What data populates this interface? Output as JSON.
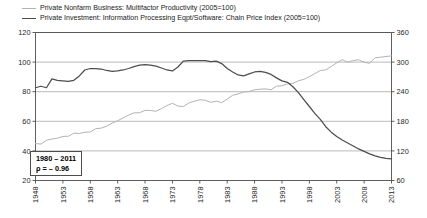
{
  "legend": {
    "position": "top-left",
    "items": [
      {
        "label": "Private Nonfarm Business: Multifactor Productivity (2005=100)",
        "color": "#b3b3b3",
        "axis": "left"
      },
      {
        "label": "Private Investment: Information Processing Eqpt/Software: Chain Price Index (2005=100)",
        "color": "#4d4d4d",
        "axis": "right"
      }
    ]
  },
  "annotation": {
    "period": "1980 – 2011",
    "correlation": "ρ = – 0.96"
  },
  "axes": {
    "left": {
      "min": 20,
      "max": 120,
      "step": 20,
      "ticks": [
        "20",
        "40",
        "60",
        "80",
        "100",
        "120"
      ]
    },
    "right": {
      "min": 60,
      "max": 360,
      "step": 60,
      "ticks": [
        "60",
        "120",
        "180",
        "240",
        "300",
        "360"
      ]
    },
    "x": {
      "min": 1948,
      "max": 2013,
      "step": 5,
      "ticks": [
        "1948",
        "1953",
        "1958",
        "1963",
        "1968",
        "1973",
        "1978",
        "1983",
        "1988",
        "1993",
        "1998",
        "2003",
        "2008",
        "2013"
      ]
    }
  },
  "chart_data": {
    "type": "line",
    "title": "",
    "subtitle": "",
    "xlabel": "",
    "ylabel": "",
    "grid": true,
    "legend_position": "top-left",
    "xlim": [
      1948,
      2013
    ],
    "ylim": [
      20,
      120
    ],
    "ylim_right": [
      60,
      360
    ],
    "x": [
      1948,
      1949,
      1950,
      1951,
      1952,
      1953,
      1954,
      1955,
      1956,
      1957,
      1958,
      1959,
      1960,
      1961,
      1962,
      1963,
      1964,
      1965,
      1966,
      1967,
      1968,
      1969,
      1970,
      1971,
      1972,
      1973,
      1974,
      1975,
      1976,
      1977,
      1978,
      1979,
      1980,
      1981,
      1982,
      1983,
      1984,
      1985,
      1986,
      1987,
      1988,
      1989,
      1990,
      1991,
      1992,
      1993,
      1994,
      1995,
      1996,
      1997,
      1998,
      1999,
      2000,
      2001,
      2002,
      2003,
      2004,
      2005,
      2006,
      2007,
      2008,
      2009,
      2010,
      2011,
      2012,
      2013
    ],
    "series": [
      {
        "name": "Private Nonfarm Business: Multifactor Productivity (2005=100)",
        "axis": "left",
        "color": "#b3b3b3",
        "units": "index, 2005=100",
        "values": [
          45.0,
          44.6,
          47.2,
          48.0,
          48.6,
          49.8,
          49.9,
          52.0,
          51.8,
          52.6,
          52.8,
          55.0,
          55.4,
          56.7,
          58.8,
          60.4,
          62.3,
          64.2,
          65.7,
          65.8,
          67.4,
          67.3,
          66.8,
          68.6,
          70.6,
          72.2,
          70.3,
          70.0,
          72.4,
          73.6,
          74.6,
          74.2,
          72.8,
          73.6,
          72.6,
          75.0,
          77.6,
          78.5,
          79.8,
          80.1,
          81.3,
          81.7,
          81.9,
          81.3,
          83.7,
          84.0,
          85.3,
          85.7,
          87.4,
          88.3,
          90.2,
          92.2,
          94.3,
          94.8,
          97.0,
          99.5,
          101.6,
          100.0,
          101.0,
          101.6,
          99.9,
          99.2,
          103.0,
          103.3,
          103.8,
          104.2
        ]
      },
      {
        "name": "Private Investment: Information Processing Eqpt/Software: Chain Price Index (2005=100)",
        "axis": "right",
        "color": "#4d4d4d",
        "units": "index, 2005=100",
        "values": [
          248,
          251,
          248,
          266,
          263,
          262,
          261,
          263,
          272,
          284,
          287,
          287,
          286,
          283,
          281,
          282,
          284,
          287,
          291,
          294,
          295,
          294,
          292,
          288,
          284,
          282,
          290,
          302,
          303,
          303,
          303,
          303,
          301,
          302,
          297,
          287,
          280,
          274,
          272,
          276,
          280,
          281,
          279,
          275,
          268,
          262,
          259,
          250,
          238,
          224,
          210,
          196,
          184,
          169,
          158,
          149,
          142,
          136,
          130,
          124,
          119,
          114,
          110,
          107,
          105,
          104
        ]
      }
    ]
  }
}
